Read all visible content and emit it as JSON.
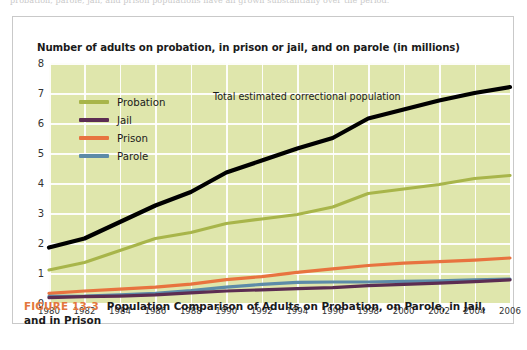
{
  "page_top_text": "probation, parole, jail, and prison populations have all grown substantially over the period.",
  "figure": {
    "number_label": "FIGURE 13-3",
    "caption": "Population Comparison of Adults on Probation, on Parole, in Jail, and in Prison",
    "number_color": "#e3773c"
  },
  "chart_title": "Number of adults on probation, in prison or jail, and on parole (in millions)",
  "annotation": "Total estimated correctional population",
  "legend": {
    "items": [
      {
        "label": "Probation",
        "color": "#a8b54a"
      },
      {
        "label": "Jail",
        "color": "#5c2d52"
      },
      {
        "label": "Prison",
        "color": "#e8733f"
      },
      {
        "label": "Parole",
        "color": "#5d8ba8"
      }
    ]
  },
  "chart_data": {
    "type": "line",
    "title": "Number of adults on probation, in prison or jail, and on parole (in millions)",
    "xlabel": "",
    "ylabel": "",
    "xlim": [
      1980,
      2006
    ],
    "ylim": [
      0,
      8
    ],
    "ytick_step": 1,
    "xtick_step": 2,
    "grid": true,
    "legend_position": "top-left-inside",
    "plot_background": "#dfe6ac",
    "gridline_color": "#ffffff",
    "annotations": [
      {
        "text": "Total estimated correctional population",
        "x": 1991,
        "y": 6.6
      }
    ],
    "x": [
      1980,
      1982,
      1984,
      1986,
      1988,
      1990,
      1992,
      1994,
      1996,
      1998,
      2000,
      2002,
      2004,
      2006
    ],
    "ytick_labels": [
      "0",
      "1",
      "2",
      "3",
      "4",
      "5",
      "6",
      "7",
      "8"
    ],
    "xtick_labels": [
      "1980",
      "1982",
      "1984",
      "1986",
      "1988",
      "1990",
      "1992",
      "1994",
      "1996",
      "1998",
      "2000",
      "2002",
      "2004",
      "2006"
    ],
    "series": [
      {
        "name": "Total estimated correctional population",
        "color": "#000000",
        "in_legend": false,
        "values": [
          1.85,
          2.15,
          2.7,
          3.25,
          3.7,
          4.35,
          4.75,
          5.15,
          5.5,
          6.15,
          6.45,
          6.75,
          7.0,
          7.2
        ]
      },
      {
        "name": "Probation",
        "color": "#a8b54a",
        "in_legend": true,
        "values": [
          1.1,
          1.35,
          1.75,
          2.15,
          2.35,
          2.65,
          2.8,
          2.95,
          3.2,
          3.65,
          3.8,
          3.95,
          4.15,
          4.25
        ]
      },
      {
        "name": "Prison",
        "color": "#e8733f",
        "in_legend": true,
        "values": [
          0.32,
          0.4,
          0.46,
          0.53,
          0.63,
          0.78,
          0.88,
          1.02,
          1.14,
          1.25,
          1.33,
          1.38,
          1.43,
          1.5
        ]
      },
      {
        "name": "Parole",
        "color": "#5d8ba8",
        "in_legend": true,
        "values": [
          0.22,
          0.23,
          0.27,
          0.32,
          0.41,
          0.53,
          0.62,
          0.69,
          0.7,
          0.7,
          0.72,
          0.74,
          0.77,
          0.8
        ]
      },
      {
        "name": "Jail",
        "color": "#5c2d52",
        "in_legend": true,
        "values": [
          0.18,
          0.21,
          0.23,
          0.27,
          0.34,
          0.4,
          0.44,
          0.48,
          0.51,
          0.58,
          0.62,
          0.66,
          0.71,
          0.77
        ]
      }
    ]
  }
}
